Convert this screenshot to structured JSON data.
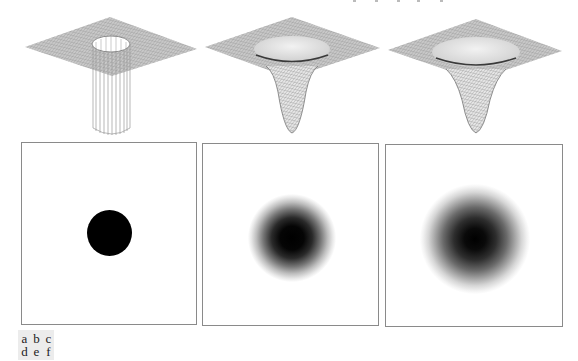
{
  "figure": {
    "panels": [
      {
        "id": "a",
        "type": "surface",
        "shape": "ideal-cylinder-well"
      },
      {
        "id": "b",
        "type": "surface",
        "shape": "gaussian-well-narrow"
      },
      {
        "id": "c",
        "type": "surface",
        "shape": "gaussian-well-wide"
      },
      {
        "id": "d",
        "type": "image",
        "shape": "sharp-disk"
      },
      {
        "id": "e",
        "type": "image",
        "shape": "gaussian-blob-narrow"
      },
      {
        "id": "f",
        "type": "image",
        "shape": "gaussian-blob-wide"
      }
    ],
    "colors": {
      "background": "#ffffff",
      "mesh": "#8c8c8c",
      "mesh_dark": "#3a3a3a",
      "panel_border": "#8a8a8a",
      "disk": "#000000",
      "legend_bg": "#ececec"
    }
  },
  "legend": {
    "rows": [
      [
        "a",
        "b",
        "c"
      ],
      [
        "d",
        "e",
        "f"
      ]
    ]
  }
}
